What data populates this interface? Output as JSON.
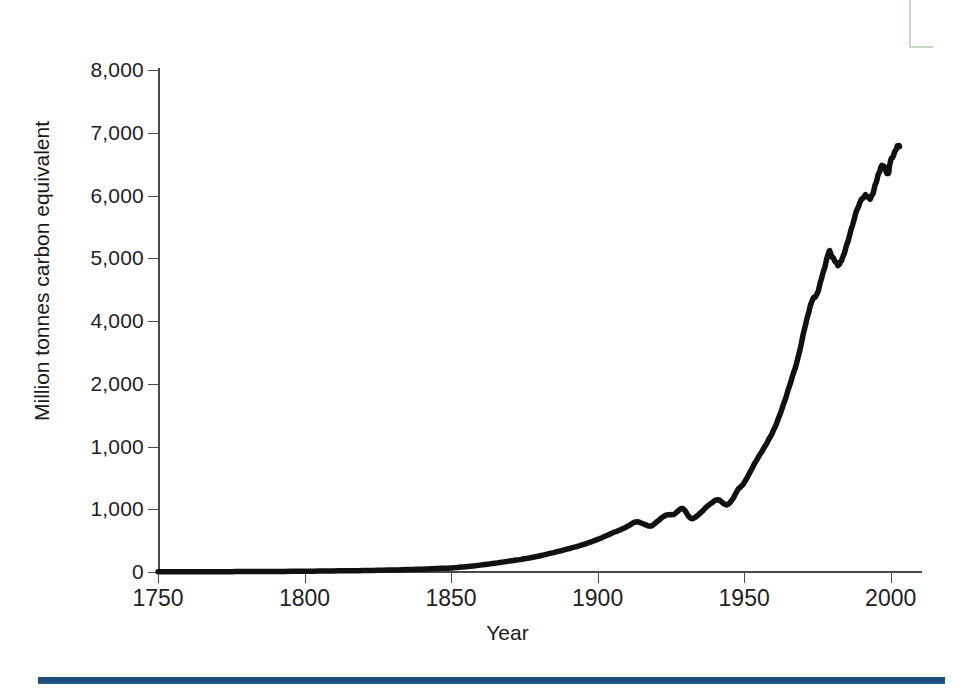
{
  "figure": {
    "name": "global-carbon-emissions-figure",
    "background_color": "#ffffff",
    "line_color": "#111111",
    "axis_color": "#4a4a4a",
    "rule_color": "#1d4f84",
    "corner_mark_color": "#bcd6bc"
  },
  "chart_data": {
    "type": "line",
    "title": "",
    "subtitle": "",
    "xlabel": "Year",
    "ylabel": "Million tonnes carbon equivalent",
    "xlim": [
      1750,
      2010
    ],
    "ylim": [
      0,
      8000
    ],
    "grid": false,
    "legend": null,
    "x_ticks": [
      "1750",
      "1800",
      "1850",
      "1900",
      "1950",
      "2000"
    ],
    "x_tick_values": [
      1750,
      1800,
      1850,
      1900,
      1950,
      2000
    ],
    "y_ticks": [
      "0",
      "1,000",
      "1,000",
      "1,000",
      "2,000",
      "4,000",
      "5,000",
      "6,000",
      "7,000",
      "8,000"
    ],
    "y_tick_values": [
      0,
      1000,
      2000,
      3000,
      4000,
      5000,
      6000,
      7000,
      8000
    ],
    "y_tick_labels_as_printed": [
      "8,000",
      "7,000",
      "6,000",
      "5,000",
      "4,000",
      "2,000",
      "1,000",
      "1,000",
      "0"
    ],
    "note_on_labels": "Printed tick labels are evenly spaced but mislabelled in the source scan: the 3,000 gridline reads '2,000' and the 2,000 gridline reads '1,000'.",
    "series": [
      {
        "name": "Global carbon emissions",
        "x": [
          1750,
          1760,
          1770,
          1780,
          1790,
          1800,
          1810,
          1820,
          1830,
          1840,
          1850,
          1855,
          1860,
          1865,
          1870,
          1875,
          1880,
          1885,
          1890,
          1895,
          1900,
          1905,
          1910,
          1913,
          1916,
          1918,
          1920,
          1923,
          1926,
          1929,
          1932,
          1935,
          1938,
          1941,
          1944,
          1946,
          1948,
          1950,
          1953,
          1956,
          1959,
          1962,
          1965,
          1968,
          1971,
          1973,
          1975,
          1977,
          1979,
          1980,
          1982,
          1983,
          1985,
          1988,
          1991,
          1993,
          1995,
          1997,
          1999,
          2000,
          2002,
          2003
        ],
        "y": [
          3,
          4,
          5,
          7,
          9,
          12,
          17,
          23,
          32,
          45,
          65,
          85,
          110,
          140,
          175,
          210,
          255,
          310,
          370,
          435,
          520,
          620,
          720,
          800,
          760,
          730,
          790,
          900,
          920,
          1010,
          850,
          940,
          1070,
          1150,
          1070,
          1160,
          1320,
          1420,
          1680,
          1920,
          2160,
          2480,
          2900,
          3350,
          3950,
          4300,
          4450,
          4780,
          5100,
          5020,
          4900,
          4950,
          5200,
          5700,
          6000,
          5950,
          6200,
          6480,
          6350,
          6550,
          6750,
          6800
        ]
      }
    ]
  },
  "axis_titles": {
    "x": "Year",
    "y": "Million tonnes carbon equivalent"
  }
}
